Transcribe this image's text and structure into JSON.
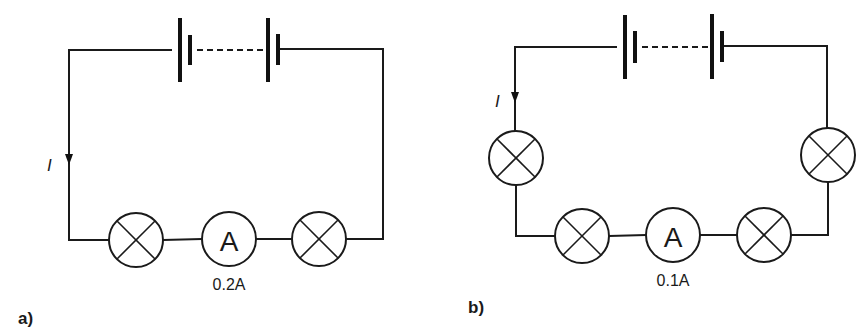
{
  "figure": {
    "colors": {
      "line": "#1a1a1a",
      "background": "#ffffff"
    }
  },
  "circuit_a": {
    "panel_label": "a)",
    "current_symbol": "I",
    "ammeter_symbol": "A",
    "ammeter_reading": "0.2A",
    "lamp_count": 2,
    "components": [
      "battery",
      "lamp",
      "ammeter",
      "lamp"
    ]
  },
  "circuit_b": {
    "panel_label": "b)",
    "current_symbol": "I",
    "ammeter_symbol": "A",
    "ammeter_reading": "0.1A",
    "lamp_count": 4,
    "components": [
      "battery",
      "lamp",
      "lamp",
      "ammeter",
      "lamp",
      "lamp"
    ]
  }
}
